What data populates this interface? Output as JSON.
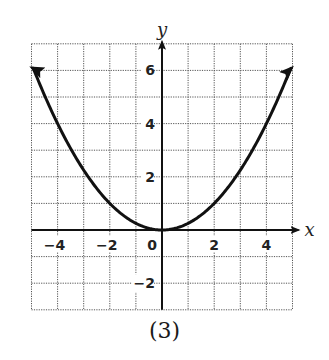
{
  "caption": "(3)",
  "chart_data": {
    "type": "line",
    "title": "",
    "xlabel": "x",
    "ylabel": "y",
    "xlim": [
      -5,
      5
    ],
    "ylim": [
      -3,
      7
    ],
    "grid": true,
    "x_ticks": [
      -4,
      -2,
      0,
      2,
      4
    ],
    "y_ticks": [
      -2,
      2,
      4,
      6
    ],
    "x_tick_labels": [
      "−4",
      "−2",
      "0",
      "2",
      "4"
    ],
    "y_tick_labels": [
      "−2",
      "2",
      "4",
      "6"
    ],
    "series": [
      {
        "name": "y = x²/4",
        "function": "0.25*x^2",
        "arrows_both_ends": true,
        "x": [
          -5,
          -4,
          -3,
          -2,
          -1,
          0,
          1,
          2,
          3,
          4,
          5
        ],
        "values": [
          6.25,
          4,
          2.25,
          1,
          0.25,
          0,
          0.25,
          1,
          2.25,
          4,
          6.25
        ]
      }
    ]
  },
  "colors": {
    "curve": "#111111",
    "axis": "#111111",
    "grid": "#555555"
  }
}
